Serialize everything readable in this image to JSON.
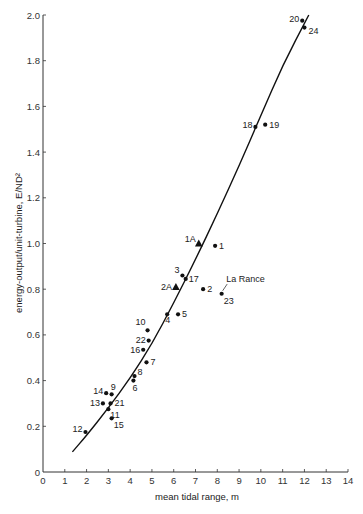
{
  "chart_data": {
    "type": "scatter",
    "title": "",
    "xlabel": "mean tidal range, m",
    "ylabel": "energy-output/unit-turbine, E/ND²",
    "xlim": [
      0,
      14
    ],
    "ylim": [
      0,
      2.0
    ],
    "grid": false,
    "legend": null,
    "x_ticks": [
      "0",
      "1",
      "2",
      "3",
      "4",
      "5",
      "6",
      "7",
      "8",
      "9",
      "10",
      "11",
      "12",
      "13",
      "14"
    ],
    "y_ticks": [
      "0",
      "0.2",
      "0.4",
      "0.6",
      "0.8",
      "1.0",
      "1.2",
      "1.4",
      "1.6",
      "1.8",
      "2.0"
    ],
    "series": [
      {
        "name": "sites (dots)",
        "marker": "circle",
        "points": [
          {
            "label": "1",
            "x": 7.9,
            "y": 0.99
          },
          {
            "label": "2",
            "x": 7.35,
            "y": 0.8
          },
          {
            "label": "3",
            "x": 6.4,
            "y": 0.86
          },
          {
            "label": "4",
            "x": 5.7,
            "y": 0.69
          },
          {
            "label": "5",
            "x": 6.2,
            "y": 0.69
          },
          {
            "label": "6",
            "x": 4.15,
            "y": 0.4
          },
          {
            "label": "7",
            "x": 4.75,
            "y": 0.48
          },
          {
            "label": "8",
            "x": 4.2,
            "y": 0.42
          },
          {
            "label": "9",
            "x": 3.15,
            "y": 0.34
          },
          {
            "label": "10",
            "x": 4.8,
            "y": 0.62
          },
          {
            "label": "11",
            "x": 3.0,
            "y": 0.275
          },
          {
            "label": "12",
            "x": 1.95,
            "y": 0.175
          },
          {
            "label": "13",
            "x": 2.75,
            "y": 0.3
          },
          {
            "label": "14",
            "x": 2.9,
            "y": 0.345
          },
          {
            "label": "15",
            "x": 3.15,
            "y": 0.235
          },
          {
            "label": "16",
            "x": 4.6,
            "y": 0.535
          },
          {
            "label": "17",
            "x": 6.55,
            "y": 0.845
          },
          {
            "label": "18",
            "x": 9.75,
            "y": 1.51
          },
          {
            "label": "19",
            "x": 10.2,
            "y": 1.52
          },
          {
            "label": "20",
            "x": 11.9,
            "y": 1.975
          },
          {
            "label": "21",
            "x": 3.1,
            "y": 0.3
          },
          {
            "label": "22",
            "x": 4.85,
            "y": 0.575
          },
          {
            "label": "23",
            "x": 8.2,
            "y": 0.78
          },
          {
            "label": "24",
            "x": 12.0,
            "y": 1.945
          }
        ]
      },
      {
        "name": "sites (triangles)",
        "marker": "triangle",
        "points": [
          {
            "label": "1A",
            "x": 7.15,
            "y": 1.0
          },
          {
            "label": "2A",
            "x": 6.1,
            "y": 0.81
          }
        ]
      },
      {
        "name": "fitted curve",
        "marker": "line",
        "points": [
          {
            "x": 1.35,
            "y": 0.088
          },
          {
            "x": 2.0,
            "y": 0.16
          },
          {
            "x": 3.0,
            "y": 0.28
          },
          {
            "x": 4.0,
            "y": 0.41
          },
          {
            "x": 5.0,
            "y": 0.56
          },
          {
            "x": 6.0,
            "y": 0.74
          },
          {
            "x": 7.0,
            "y": 0.93
          },
          {
            "x": 8.0,
            "y": 1.13
          },
          {
            "x": 9.0,
            "y": 1.34
          },
          {
            "x": 10.0,
            "y": 1.56
          },
          {
            "x": 11.0,
            "y": 1.78
          },
          {
            "x": 12.2,
            "y": 2.0
          }
        ]
      }
    ],
    "annotations": [
      {
        "text": "La Rance",
        "points_to": "23",
        "x": 8.5,
        "y": 0.84
      }
    ]
  }
}
